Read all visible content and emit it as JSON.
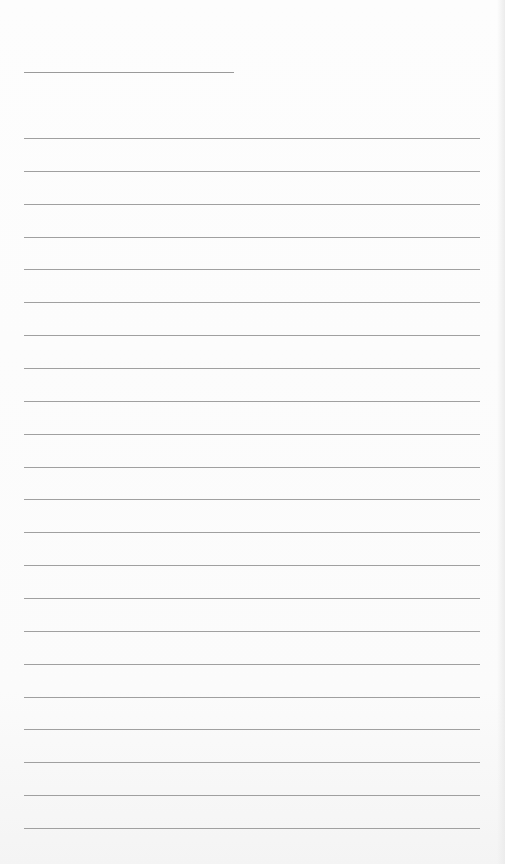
{
  "page": {
    "type": "lined paper",
    "header_line": {
      "left": 24,
      "top": 72,
      "width": 210
    },
    "rules": {
      "count": 22,
      "left": 24,
      "width": 456,
      "first_top": 138,
      "spacing": 32.86
    },
    "line_color": "#a0a0a0",
    "paper_color": "#fdfdfd"
  }
}
